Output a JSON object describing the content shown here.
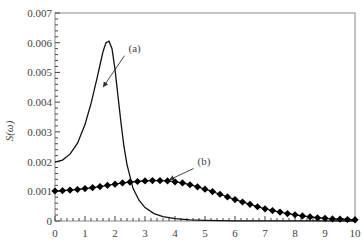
{
  "chart_data": {
    "type": "line",
    "title": "",
    "xlabel": "",
    "ylabel": "S(ω)",
    "xlim": [
      0,
      10
    ],
    "ylim": [
      0,
      0.007
    ],
    "xticks": [
      "0",
      "1",
      "2",
      "3",
      "4",
      "5",
      "6",
      "7",
      "8",
      "9",
      "10"
    ],
    "yticks": [
      "0",
      "0.001",
      "0.002",
      "0.003",
      "0.004",
      "0.005",
      "0.006",
      "0.007"
    ],
    "grid": false,
    "series": [
      {
        "name": "(a)",
        "style": "solid line",
        "x": [
          0,
          0.25,
          0.5,
          0.75,
          1.0,
          1.2,
          1.4,
          1.5,
          1.6,
          1.7,
          1.8,
          1.9,
          2.0,
          2.1,
          2.2,
          2.3,
          2.4,
          2.6,
          2.8,
          3.0,
          3.3,
          3.6,
          4.0,
          4.5,
          5.0,
          5.5,
          6,
          7,
          8,
          9,
          10
        ],
        "values": [
          0.00198,
          0.00205,
          0.00225,
          0.00262,
          0.00325,
          0.00395,
          0.0048,
          0.00525,
          0.0057,
          0.006,
          0.00605,
          0.0058,
          0.0051,
          0.0042,
          0.0033,
          0.0025,
          0.0019,
          0.0011,
          0.0007,
          0.00045,
          0.00025,
          0.00015,
          8e-05,
          4e-05,
          2e-05,
          1e-05,
          6e-06,
          3e-06,
          2e-06,
          1e-06,
          5e-07
        ]
      },
      {
        "name": "(b)",
        "style": "line with diamond markers",
        "x": [
          0,
          0.25,
          0.5,
          0.75,
          1.0,
          1.25,
          1.5,
          1.75,
          2.0,
          2.25,
          2.5,
          2.75,
          3.0,
          3.25,
          3.5,
          3.75,
          4.0,
          4.25,
          4.5,
          4.75,
          5.0,
          5.25,
          5.5,
          5.75,
          6.0,
          6.25,
          6.5,
          6.75,
          7.0,
          7.25,
          7.5,
          7.75,
          8.0,
          8.25,
          8.5,
          8.75,
          9.0,
          9.25,
          9.5,
          9.75,
          10.0
        ],
        "values": [
          0.00101,
          0.00102,
          0.00104,
          0.00106,
          0.00109,
          0.00112,
          0.00116,
          0.0012,
          0.00124,
          0.00128,
          0.00131,
          0.00133,
          0.00135,
          0.00136,
          0.00136,
          0.00135,
          0.00132,
          0.00128,
          0.00122,
          0.00115,
          0.00107,
          0.00099,
          0.0009,
          0.00081,
          0.00072,
          0.00064,
          0.00056,
          0.00048,
          0.00041,
          0.00035,
          0.0003,
          0.00025,
          0.00021,
          0.00017,
          0.00014,
          0.00011,
          9e-05,
          7e-05,
          6e-05,
          5e-05,
          4e-05
        ]
      }
    ],
    "annotations": [
      {
        "text": "(a)",
        "label_x": 2.45,
        "label_y": 0.0057,
        "arrow_to_x": 1.6,
        "arrow_to_y": 0.0045
      },
      {
        "text": "(b)",
        "label_x": 4.75,
        "label_y": 0.0019,
        "arrow_to_x": 3.8,
        "arrow_to_y": 0.00138
      }
    ]
  }
}
